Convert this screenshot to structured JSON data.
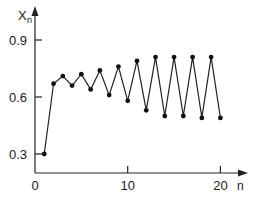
{
  "chart_data": {
    "type": "line",
    "title": "",
    "xlabel": "n",
    "ylabel": "X_n",
    "ylabel_main": "X",
    "ylabel_sub": "n",
    "xlim": [
      0,
      21
    ],
    "ylim": [
      0.25,
      1.0
    ],
    "grid": false,
    "legend": null,
    "xticks": [
      0,
      10,
      20
    ],
    "xtick_labels": [
      "0",
      "10",
      "20"
    ],
    "yticks": [
      0.3,
      0.6,
      0.9
    ],
    "ytick_labels": [
      "0.3",
      "0.6",
      "0.9"
    ],
    "series": [
      {
        "name": "x_n",
        "marker": "circle",
        "x": [
          1,
          2,
          3,
          4,
          5,
          6,
          7,
          8,
          9,
          10,
          11,
          12,
          13,
          14,
          15,
          16,
          17,
          18,
          19,
          20
        ],
        "values": [
          0.3,
          0.67,
          0.71,
          0.66,
          0.72,
          0.64,
          0.74,
          0.61,
          0.76,
          0.58,
          0.79,
          0.53,
          0.81,
          0.5,
          0.81,
          0.5,
          0.81,
          0.49,
          0.81,
          0.49
        ]
      }
    ]
  }
}
